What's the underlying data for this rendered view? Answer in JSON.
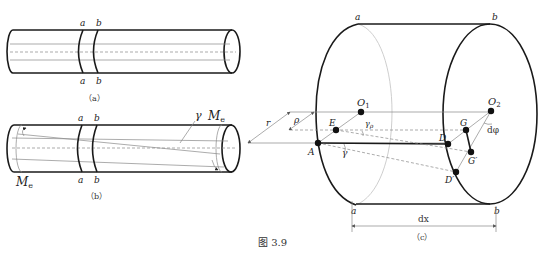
{
  "figure": {
    "caption": "图 3.9",
    "panels": {
      "a": {
        "caption": "（a）",
        "section_labels_top": [
          "a",
          "b"
        ],
        "section_labels_bottom": [
          "a",
          "b"
        ]
      },
      "b": {
        "caption": "（b）",
        "section_labels_top": [
          "a",
          "b"
        ],
        "section_labels_bottom": [
          "a",
          "b"
        ],
        "shear_angle": "γ",
        "torque_right": "M",
        "torque_right_sub": "e",
        "torque_left": "M",
        "torque_left_sub": "e"
      },
      "c": {
        "caption": "（c）",
        "section_top_left": "a",
        "section_top_right": "b",
        "section_bottom_left": "a",
        "section_bottom_right": "b",
        "dim_r": "r",
        "dim_rho": "ρ",
        "point_O1": "O",
        "point_O1_sub": "1",
        "point_O2": "O",
        "point_O2_sub": "2",
        "point_E": "E",
        "point_G": "G",
        "point_D": "D",
        "point_G_prime": "G′",
        "point_A": "A",
        "point_D_prime": "D′",
        "angle_gamma_rho": "γ",
        "angle_gamma_rho_sub": "ρ",
        "angle_gamma": "γ",
        "angle_dphi": "dφ",
        "length_dx": "dx"
      }
    }
  }
}
